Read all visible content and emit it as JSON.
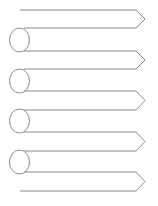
{
  "diagram": {
    "type": "ribbon-arrow-list",
    "stroke_color": "#8a8a8a",
    "background": "#ffffff",
    "arrows": [
      {
        "top": 10,
        "bottom": 28,
        "label": ""
      },
      {
        "top": 51,
        "bottom": 69,
        "label": ""
      },
      {
        "top": 91,
        "bottom": 110,
        "label": ""
      },
      {
        "top": 132,
        "bottom": 151,
        "label": ""
      },
      {
        "top": 172,
        "bottom": 191,
        "label": ""
      }
    ],
    "circles": [
      {
        "cy": 40
      },
      {
        "cy": 81
      },
      {
        "cy": 121
      },
      {
        "cy": 162
      }
    ]
  }
}
